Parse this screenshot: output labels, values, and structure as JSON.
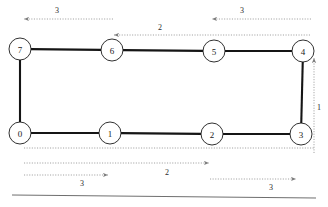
{
  "figure": {
    "background_color": "#ffffff",
    "edge_color": "#151515",
    "node_fill": "#ffffff",
    "node_stroke": "#1a1a1a",
    "dimension_color": "#8a8a8a",
    "label_color": "#2b2b2b"
  },
  "nodes": [
    {
      "id": "node-7",
      "label": "7",
      "cx": 20,
      "cy": 49,
      "r": 11
    },
    {
      "id": "node-6",
      "label": "6",
      "cx": 112,
      "cy": 50,
      "r": 11
    },
    {
      "id": "node-5",
      "label": "5",
      "cx": 214,
      "cy": 51,
      "r": 11
    },
    {
      "id": "node-4",
      "label": "4",
      "cx": 303,
      "cy": 51,
      "r": 11
    },
    {
      "id": "node-0",
      "label": "0",
      "cx": 20,
      "cy": 133,
      "r": 11
    },
    {
      "id": "node-1",
      "label": "1",
      "cx": 110,
      "cy": 133,
      "r": 11
    },
    {
      "id": "node-2",
      "label": "2",
      "cx": 212,
      "cy": 134,
      "r": 11
    },
    {
      "id": "node-3",
      "label": "3",
      "cx": 301,
      "cy": 134,
      "r": 11
    }
  ],
  "edges": [
    {
      "id": "edge-7-6",
      "from": "node-7",
      "to": "node-6"
    },
    {
      "id": "edge-6-5",
      "from": "node-6",
      "to": "node-5"
    },
    {
      "id": "edge-5-4",
      "from": "node-5",
      "to": "node-4"
    },
    {
      "id": "edge-4-3",
      "from": "node-4",
      "to": "node-3"
    },
    {
      "id": "edge-3-2",
      "from": "node-3",
      "to": "node-2"
    },
    {
      "id": "edge-2-1",
      "from": "node-2",
      "to": "node-1"
    },
    {
      "id": "edge-1-0",
      "from": "node-1",
      "to": "node-0"
    },
    {
      "id": "edge-0-7",
      "from": "node-0",
      "to": "node-7"
    }
  ],
  "dimensions": [
    {
      "id": "dim-top-left-3",
      "label": "3",
      "label_x": 57,
      "label_y": 10,
      "x1": 113,
      "y1": 19,
      "x2": 24,
      "y2": 19,
      "direction": "left"
    },
    {
      "id": "dim-top-right-3",
      "label": "3",
      "label_x": 242,
      "label_y": 10,
      "x1": 311,
      "y1": 19,
      "x2": 212,
      "y2": 19,
      "direction": "left"
    },
    {
      "id": "dim-top-middle-2",
      "label": "2",
      "label_x": 160,
      "label_y": 27,
      "x1": 310,
      "y1": 35,
      "x2": 114,
      "y2": 35,
      "direction": "left"
    },
    {
      "id": "dim-right-1",
      "label": "1",
      "label_x": 319,
      "label_y": 107,
      "x1": 314,
      "y1": 153,
      "x2": 314,
      "y2": 58,
      "direction": "up"
    },
    {
      "id": "dim-bottom-middle-2",
      "label": "2",
      "label_x": 167,
      "label_y": 172,
      "x1": 24,
      "y1": 163,
      "x2": 209,
      "y2": 163,
      "direction": "right"
    },
    {
      "id": "dim-bottom-left-3",
      "label": "3",
      "label_x": 82,
      "label_y": 183,
      "x1": 24,
      "y1": 175,
      "x2": 108,
      "y2": 175,
      "direction": "right"
    },
    {
      "id": "dim-bottom-right-3",
      "label": "3",
      "label_x": 271,
      "label_y": 187,
      "x1": 210,
      "y1": 179,
      "x2": 296,
      "y2": 179,
      "direction": "right"
    }
  ],
  "extension_lines": [
    {
      "id": "ext-bottom-baseline",
      "x1": 24,
      "y1": 148,
      "x2": 314,
      "y2": 148
    }
  ],
  "divider": {
    "id": "bottom-divider",
    "x1": 12,
    "y1": 195,
    "x2": 316,
    "y2": 198
  }
}
